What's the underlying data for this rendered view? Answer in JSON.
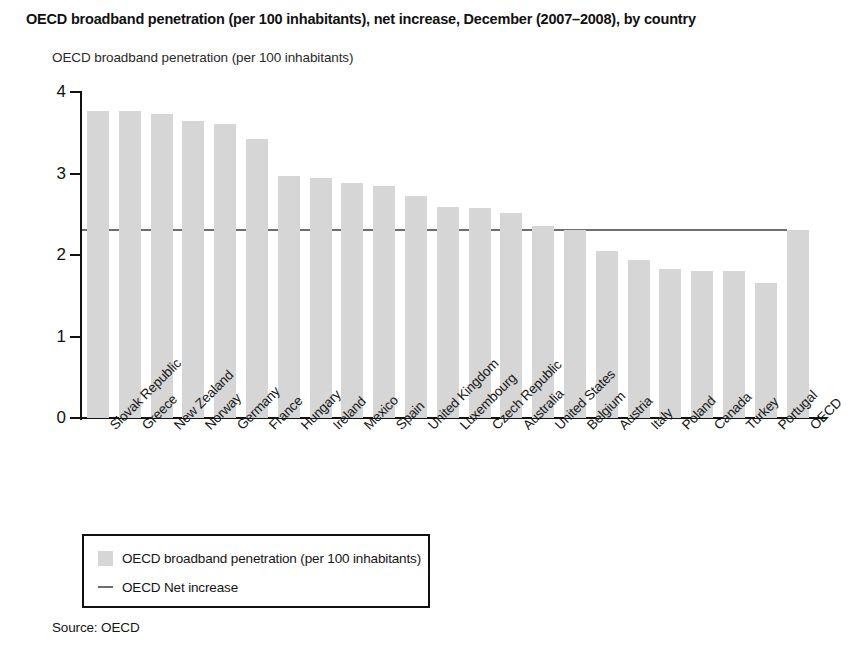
{
  "chart_data": {
    "type": "bar",
    "title": "OECD broadband penetration (per 100 inhabitants), net increase, December (2007–2008), by country",
    "subtitle": "OECD broadband penetration (per 100 inhabitants)",
    "xlabel": "",
    "ylabel": "OECD broadband penetration (per 100 inhabitants)",
    "ylim": [
      0,
      4
    ],
    "yticks": [
      0,
      1,
      2,
      3,
      4
    ],
    "ytick_labels": [
      "0",
      "1",
      "2",
      "3",
      "4"
    ],
    "grid": false,
    "legend_position": "below-plot-left",
    "bar_color": "#d6d6d6",
    "line_color": "#6e6e6e",
    "categories": [
      "Slovak Republic",
      "Greece",
      "New Zealand",
      "Norway",
      "Germany",
      "France",
      "Hungary",
      "Ireland",
      "Mexico",
      "Spain",
      "United Kingdom",
      "Luxembourg",
      "Czech Republic",
      "Australia",
      "United States",
      "Belgium",
      "Austria",
      "Italy",
      "Poland",
      "Canada",
      "Turkey",
      "Portugal",
      "OECD"
    ],
    "values": [
      3.77,
      3.77,
      3.73,
      3.65,
      3.61,
      3.42,
      2.97,
      2.94,
      2.88,
      2.85,
      2.73,
      2.59,
      2.58,
      2.52,
      2.36,
      2.31,
      2.05,
      1.94,
      1.83,
      1.81,
      1.8,
      1.66,
      2.31
    ],
    "series": [
      {
        "name": "OECD broadband penetration (per 100 inhabitants)",
        "values": [
          3.77,
          3.77,
          3.73,
          3.65,
          3.61,
          3.42,
          2.97,
          2.94,
          2.88,
          2.85,
          2.73,
          2.59,
          2.58,
          2.52,
          2.36,
          2.31,
          2.05,
          1.94,
          1.83,
          1.81,
          1.8,
          1.66,
          2.31
        ]
      }
    ],
    "reference_line": {
      "name": "OECD Net increase",
      "value": 2.32
    },
    "legend": [
      {
        "label": "OECD broadband penetration (per 100 inhabitants)",
        "marker": "box"
      },
      {
        "label": "OECD Net increase",
        "marker": "line"
      }
    ],
    "source": "Source: OECD"
  }
}
